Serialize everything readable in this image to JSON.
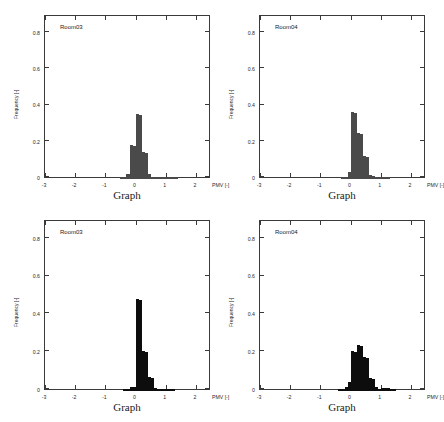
{
  "figure": {
    "panel_count": 4,
    "x_axis_unit": "PMV [-]",
    "y_axis_label": "Frequency [-]",
    "x_axis_title": "Graph"
  },
  "panels": [
    {
      "id": "panel-top-left",
      "room_label": "Room03",
      "bar_color": "#4a4a4a",
      "x_title": "Graph",
      "y_label": "Frequency [-]",
      "x_unit": "PMV [-]",
      "chart_data": {
        "type": "bar",
        "title": "Room03",
        "xlabel": "PMV [-]",
        "ylabel": "Frequency [-]",
        "xlim": [
          -3.0,
          2.5
        ],
        "ylim": [
          0,
          0.9
        ],
        "xticks": [
          -3,
          -2,
          -1,
          0,
          1,
          2
        ],
        "yticks": [
          0,
          0.2,
          0.4,
          0.6,
          0.8
        ],
        "bin_width": 0.1,
        "grid": false,
        "legend": "none",
        "x": [
          -0.45,
          -0.35,
          -0.25,
          -0.15,
          -0.05,
          0.05,
          0.15,
          0.25,
          0.35,
          0.45,
          0.55,
          0.65,
          0.75,
          0.85,
          0.95,
          1.05,
          1.15,
          1.25,
          1.35
        ],
        "values": [
          0.005,
          0.012,
          0.03,
          0.19,
          0.185,
          0.36,
          0.355,
          0.15,
          0.145,
          0.025,
          0.012,
          0.012,
          0.012,
          0.012,
          0.008,
          0.008,
          0.006,
          0.005,
          0.003
        ]
      }
    },
    {
      "id": "panel-top-right",
      "room_label": "Room04",
      "bar_color": "#4a4a4a",
      "x_title": "Graph",
      "y_label": "Frequency [-]",
      "x_unit": "PMV [-]",
      "chart_data": {
        "type": "bar",
        "title": "Room04",
        "xlabel": "PMV [-]",
        "ylabel": "Frequency [-]",
        "xlim": [
          -3.0,
          2.5
        ],
        "ylim": [
          0,
          0.9
        ],
        "xticks": [
          -3,
          -2,
          -1,
          0,
          1,
          2
        ],
        "yticks": [
          0,
          0.2,
          0.4,
          0.6,
          0.8
        ],
        "bin_width": 0.1,
        "grid": false,
        "legend": "none",
        "x": [
          -0.25,
          -0.15,
          -0.05,
          0.05,
          0.15,
          0.25,
          0.35,
          0.45,
          0.55,
          0.65,
          0.75,
          0.85,
          0.95,
          1.05,
          1.15,
          1.25
        ],
        "values": [
          0.004,
          0.008,
          0.04,
          0.37,
          0.365,
          0.255,
          0.25,
          0.125,
          0.12,
          0.02,
          0.015,
          0.012,
          0.012,
          0.008,
          0.005,
          0.003
        ]
      }
    },
    {
      "id": "panel-bottom-left",
      "room_label": "Room03",
      "bar_color": "#0d0d0d",
      "x_title": "Graph",
      "y_label": "Frequency [-]",
      "x_unit": "PMV [-]",
      "chart_data": {
        "type": "bar",
        "title": "Room03",
        "xlabel": "PMV [-]",
        "ylabel": "Frequency [-]",
        "xlim": [
          -3.0,
          2.5
        ],
        "ylim": [
          0,
          0.9
        ],
        "xticks": [
          -3,
          -2,
          -1,
          0,
          1,
          2
        ],
        "yticks": [
          0,
          0.2,
          0.4,
          0.6,
          0.8
        ],
        "bin_width": 0.1,
        "grid": false,
        "legend": "none",
        "x": [
          -0.35,
          -0.25,
          -0.15,
          -0.05,
          0.05,
          0.15,
          0.25,
          0.35,
          0.45,
          0.55,
          0.65,
          0.75,
          0.85,
          0.95,
          1.05,
          1.15,
          1.25
        ],
        "values": [
          0.004,
          0.006,
          0.02,
          0.022,
          0.485,
          0.48,
          0.21,
          0.205,
          0.075,
          0.07,
          0.018,
          0.012,
          0.008,
          0.006,
          0.005,
          0.004,
          0.003
        ]
      }
    },
    {
      "id": "panel-bottom-right",
      "room_label": "Room04",
      "bar_color": "#0d0d0d",
      "x_title": "Graph",
      "y_label": "Frequency [-]",
      "x_unit": "PMV [-]",
      "chart_data": {
        "type": "bar",
        "title": "Room04",
        "xlabel": "PMV [-]",
        "ylabel": "Frequency [-]",
        "xlim": [
          -3.0,
          2.5
        ],
        "ylim": [
          0,
          0.9
        ],
        "xticks": [
          -3,
          -2,
          -1,
          0,
          1,
          2
        ],
        "yticks": [
          0,
          0.2,
          0.4,
          0.6,
          0.8
        ],
        "bin_width": 0.1,
        "grid": false,
        "legend": "none",
        "x": [
          -0.35,
          -0.25,
          -0.15,
          -0.05,
          0.05,
          0.15,
          0.25,
          0.35,
          0.45,
          0.55,
          0.65,
          0.75,
          0.85,
          0.95,
          1.05,
          1.15,
          1.25,
          1.35,
          1.45
        ],
        "values": [
          0.004,
          0.006,
          0.022,
          0.05,
          0.21,
          0.205,
          0.245,
          0.24,
          0.18,
          0.175,
          0.07,
          0.065,
          0.02,
          0.012,
          0.018,
          0.016,
          0.016,
          0.012,
          0.006
        ]
      }
    }
  ]
}
